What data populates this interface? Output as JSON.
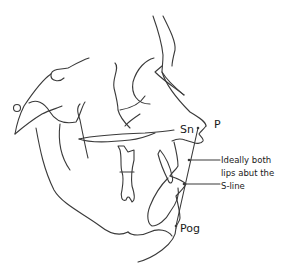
{
  "diagram": {
    "type": "cephalometric tracing (soft-tissue profile, lateral view)",
    "colors": {
      "line": "#3a3a3a",
      "text": "#1a1a1a",
      "background": "#ffffff"
    },
    "labels": {
      "subnasale": "Sn",
      "pronasale": "P",
      "pogonion": "Pog"
    },
    "annotation": {
      "line1": "Ideally both",
      "line2": "lips abut the",
      "line3": "S-line"
    },
    "reference_line": {
      "name": "S-line",
      "from_label": "P",
      "to_label": "Pog"
    }
  }
}
